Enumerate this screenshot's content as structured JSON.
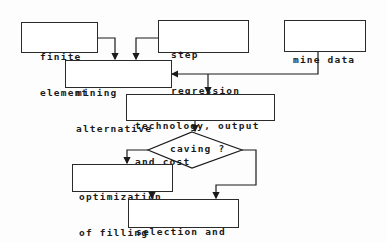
{
  "diagram": {
    "type": "flowchart",
    "nodes": [
      {
        "id": "finite_element",
        "shape": "rect",
        "label_line1": "finite",
        "label_line2": "element"
      },
      {
        "id": "step_regression",
        "shape": "rect",
        "label_line1": "step",
        "label_line2": "regression"
      },
      {
        "id": "mine_data",
        "shape": "rect",
        "label_line1": "mine data"
      },
      {
        "id": "mining_alternative",
        "shape": "rect",
        "label_line1": "mining",
        "label_line2": "alternative"
      },
      {
        "id": "technology",
        "shape": "rect",
        "label_line1": "technology, output",
        "label_line2": "and cost"
      },
      {
        "id": "caving",
        "shape": "diamond",
        "label_line1": "caving ?"
      },
      {
        "id": "optimization",
        "shape": "rect",
        "label_line1": "optimization",
        "label_line2": "of filling"
      },
      {
        "id": "selection",
        "shape": "rect",
        "label_line1": "selection and",
        "label_line2": "decision"
      }
    ],
    "edges": [
      {
        "from": "finite_element",
        "to": "mining_alternative"
      },
      {
        "from": "step_regression",
        "to": "mining_alternative"
      },
      {
        "from": "mine_data",
        "to": "mining_alternative"
      },
      {
        "from": "mine_data",
        "to": "technology"
      },
      {
        "from": "technology",
        "to": "caving"
      },
      {
        "from": "caving",
        "to": "optimization"
      },
      {
        "from": "caving",
        "to": "selection"
      },
      {
        "from": "optimization",
        "to": "selection"
      }
    ]
  }
}
